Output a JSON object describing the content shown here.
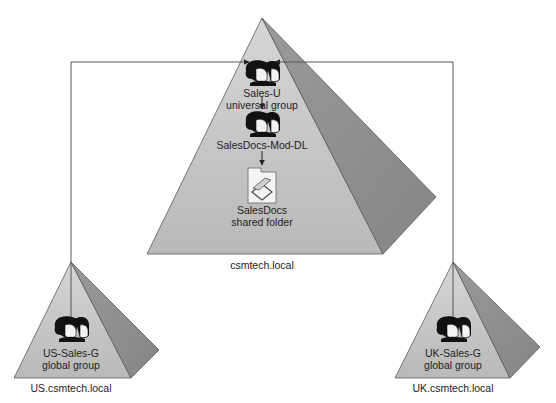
{
  "diagram": {
    "domains": [
      {
        "id": "root",
        "name": "csmtech.local",
        "objects": [
          {
            "type": "group",
            "name": "Sales-U",
            "scope": "universal group"
          },
          {
            "type": "group",
            "name": "SalesDocs-Mod-DL",
            "scope": ""
          },
          {
            "type": "shared-folder",
            "name": "SalesDocs",
            "scope": "shared folder"
          }
        ]
      },
      {
        "id": "us",
        "name": "US.csmtech.local",
        "objects": [
          {
            "type": "group",
            "name": "US-Sales-G",
            "scope": "global group"
          }
        ]
      },
      {
        "id": "uk",
        "name": "UK.csmtech.local",
        "objects": [
          {
            "type": "group",
            "name": "UK-Sales-G",
            "scope": "global group"
          }
        ]
      }
    ],
    "connections": [
      {
        "from": "US-Sales-G",
        "to": "Sales-U",
        "type": "membership"
      },
      {
        "from": "UK-Sales-G",
        "to": "Sales-U",
        "type": "membership"
      },
      {
        "from": "Sales-U",
        "to": "SalesDocs-Mod-DL",
        "type": "membership"
      },
      {
        "from": "SalesDocs-Mod-DL",
        "to": "SalesDocs",
        "type": "permission"
      }
    ],
    "colors": {
      "face_light": "#c4c4c4",
      "face_dark": "#8f8f8f",
      "edge": "#5a5a5a",
      "line": "#555555",
      "icon": "#111111"
    }
  }
}
